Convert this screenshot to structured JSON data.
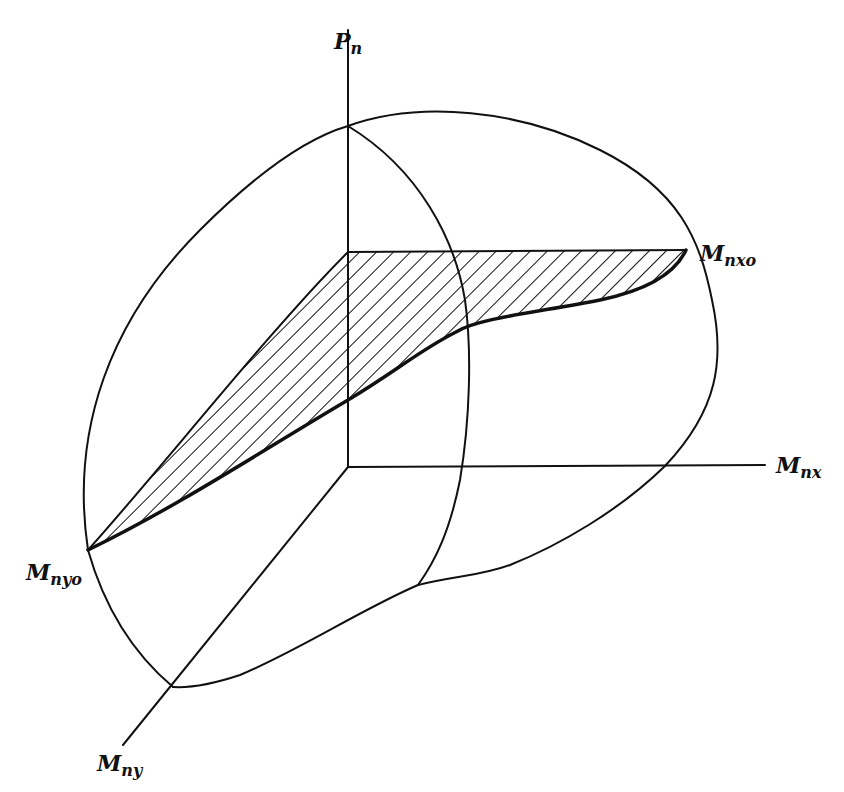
{
  "figure": {
    "colors": {
      "ink": "#111111",
      "background": "#ffffff"
    },
    "hatch": {
      "pattern": "diagonal-lines",
      "spacing_px": 12
    }
  },
  "axes": {
    "vertical": {
      "label_main": "P",
      "label_sub": "n"
    },
    "x": {
      "label_main": "M",
      "label_sub": "nx"
    },
    "y": {
      "label_main": "M",
      "label_sub": "ny"
    }
  },
  "points": {
    "mnxo": {
      "label_main": "M",
      "label_sub": "nxo"
    },
    "mnyo": {
      "label_main": "M",
      "label_sub": "nyo"
    }
  }
}
